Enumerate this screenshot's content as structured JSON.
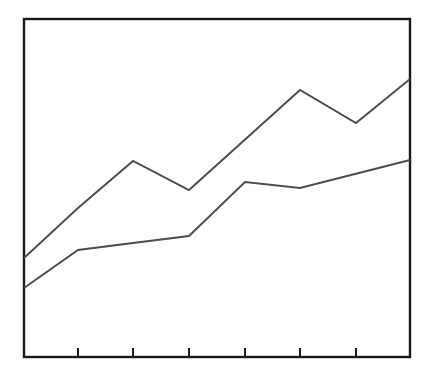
{
  "chart_data": {
    "type": "line",
    "title": "",
    "subtitle": "",
    "xlabel": "",
    "ylabel": "",
    "grid": {
      "horizontal": true,
      "vertical": true,
      "horizontal_style": "solid",
      "vertical_style": "dotted",
      "horizontal_color": "#b3b3b3",
      "vertical_color": "#c9c9c9"
    },
    "legend": {
      "visible": false,
      "position": "none",
      "entries": []
    },
    "axes": {
      "xlim": [
        0,
        7
      ],
      "ylim": [
        0,
        6
      ],
      "x_tick_values": [
        1,
        2,
        3,
        4,
        5,
        6
      ],
      "x_tick_labels": [
        "",
        "",
        "",
        "",
        "",
        ""
      ],
      "y_tick_values": [
        1,
        2,
        3,
        4,
        5
      ],
      "y_tick_labels": [
        "",
        "",
        "",
        "",
        ""
      ],
      "x_tick_marks_visible": true,
      "y_tick_marks_visible": false,
      "frame_visible": true,
      "frame_color": "#1a1a1a"
    },
    "x": [
      0,
      1,
      2,
      3,
      4,
      5,
      6,
      7
    ],
    "series": [
      {
        "name": "series-a",
        "color": "#4d4d4d",
        "style": "solid",
        "values": [
          1.76,
          2.64,
          3.48,
          2.96,
          3.94,
          4.73,
          4.15,
          4.93
        ]
      },
      {
        "name": "series-b",
        "color": "#4d4d4d",
        "style": "solid",
        "values": [
          1.23,
          1.91,
          2.03,
          2.15,
          3.11,
          3.0,
          3.29,
          3.5
        ]
      }
    ],
    "annotations": []
  },
  "geometry": {
    "width": 432,
    "height": 387,
    "plot": {
      "left": 24,
      "top": 19,
      "right": 410,
      "bottom": 357
    },
    "hgrid_y": [
      77,
      133,
      190,
      246,
      302
    ],
    "vgrid_x": [
      78,
      133,
      189,
      245,
      300,
      356
    ],
    "tick_length": 9,
    "series_points": [
      [
        [
          24,
          258
        ],
        [
          78,
          208
        ],
        [
          133,
          161
        ],
        [
          189,
          190
        ],
        [
          300,
          90
        ],
        [
          356,
          123
        ],
        [
          410,
          79
        ]
      ],
      [
        [
          24,
          288
        ],
        [
          78,
          250
        ],
        [
          133,
          243
        ],
        [
          189,
          236
        ],
        [
          245,
          182
        ],
        [
          300,
          188
        ],
        [
          410,
          160
        ]
      ]
    ]
  }
}
